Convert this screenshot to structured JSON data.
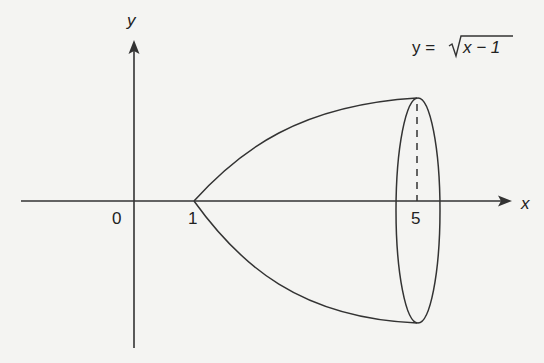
{
  "diagram": {
    "axes": {
      "x_label": "x",
      "y_label": "y",
      "origin_label": "0"
    },
    "ticks": {
      "one": "1",
      "five": "5"
    },
    "equation": {
      "lhs": "y =",
      "radicand": "x − 1"
    },
    "colors": {
      "stroke": "#333333",
      "background": "#f4f4f2"
    }
  }
}
